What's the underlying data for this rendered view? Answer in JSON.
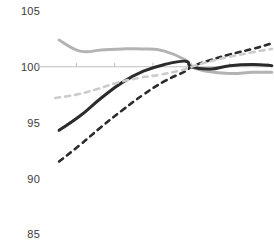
{
  "chart_data": {
    "type": "line",
    "title": "",
    "subtitle": "",
    "xlabel": "",
    "ylabel": "",
    "ylim": [
      85,
      105
    ],
    "xlim": [
      0,
      6
    ],
    "grid": false,
    "legend_position": "none",
    "baseline_value": 100,
    "y_ticks": [
      105,
      100,
      95,
      90,
      85
    ],
    "y_tick_labels": [
      "105",
      "100",
      "95",
      "90",
      "85"
    ],
    "x_ticks": [
      0,
      1,
      2,
      3,
      4,
      5,
      6
    ],
    "x_tick_labels": [
      "",
      "",
      "",
      "",
      "",
      "",
      ""
    ],
    "colors": {
      "series_1": "#b3b3b3",
      "series_2": "#2b2b2b",
      "series_3": "#2b2b2b",
      "series_4": "#cccccc",
      "axis": "#bfbfbf",
      "label": "#3a3a3a"
    },
    "series": [
      {
        "name": "series-1",
        "style": "solid",
        "color": "#b3b3b3",
        "width": 3.0,
        "x": [
          0.55,
          1.1,
          1.65,
          2.2,
          2.75,
          3.3,
          3.85,
          4.0,
          4.4,
          5.0,
          5.6,
          6.1
        ],
        "values": [
          102.4,
          101.4,
          101.5,
          101.6,
          101.6,
          101.4,
          100.6,
          100.0,
          99.6,
          99.4,
          99.5,
          99.5
        ]
      },
      {
        "name": "series-2",
        "style": "solid",
        "color": "#2b2b2b",
        "width": 3.0,
        "x": [
          0.55,
          1.1,
          1.65,
          2.2,
          2.75,
          3.3,
          3.85,
          4.0,
          4.5,
          5.0,
          5.6,
          6.1
        ],
        "values": [
          94.3,
          95.6,
          97.2,
          98.6,
          99.6,
          100.2,
          100.5,
          100.0,
          99.8,
          100.1,
          100.2,
          100.1
        ]
      },
      {
        "name": "series-3",
        "style": "dashed",
        "color": "#2b2b2b",
        "width": 2.6,
        "x": [
          0.55,
          1.1,
          1.65,
          2.2,
          2.75,
          3.3,
          3.85,
          4.0,
          4.5,
          5.0,
          5.6,
          6.1
        ],
        "values": [
          91.5,
          93.0,
          94.6,
          96.1,
          97.5,
          98.7,
          99.6,
          100.0,
          100.6,
          101.1,
          101.6,
          102.1
        ]
      },
      {
        "name": "series-4",
        "style": "dashed",
        "color": "#cccccc",
        "width": 2.6,
        "x": [
          0.45,
          1.0,
          1.55,
          2.1,
          2.65,
          3.2,
          3.75,
          4.0,
          4.5,
          5.0,
          5.6,
          6.1
        ],
        "values": [
          97.2,
          97.5,
          98.0,
          98.6,
          99.0,
          99.3,
          99.7,
          100.0,
          100.5,
          100.9,
          101.3,
          101.6
        ]
      }
    ]
  },
  "axis": {
    "baseline_label": "100"
  }
}
